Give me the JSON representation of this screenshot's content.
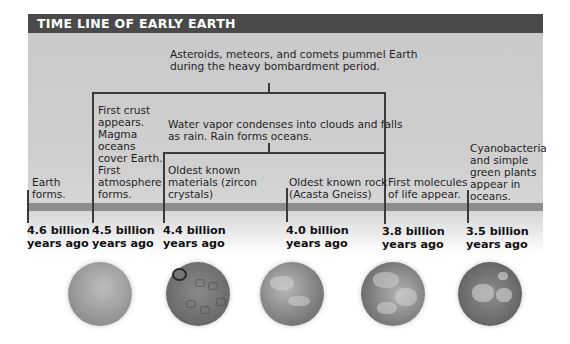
{
  "title": "TIME LINE OF EARLY EARTH",
  "brackets": {
    "bombardment": "Asteroids, meteors, and comets pummel Earth during the heavy bombardment period.",
    "bombardment_lines": [
      "Asteroids, meteors, and comets pummel Earth",
      "during the heavy bombardment period."
    ],
    "water_lines": [
      "Water vapor condenses into clouds and falls",
      "as rain. Rain forms oceans."
    ]
  },
  "events": [
    {
      "lines": [
        "Earth",
        "forms."
      ],
      "date_line1": "4.6 billion",
      "date_line2": "years ago"
    },
    {
      "lines": [
        "First crust",
        "appears.",
        "Magma",
        "oceans",
        "cover Earth.",
        "First",
        "atmosphere",
        "forms."
      ],
      "date_line1": "4.5 billion",
      "date_line2": "years ago"
    },
    {
      "lines": [
        "Oldest known",
        "materials (zircon",
        "crystals)"
      ],
      "date_line1": "4.4 billion",
      "date_line2": "years ago"
    },
    {
      "lines": [
        "Oldest known rock",
        "(Acasta Gneiss)"
      ],
      "date_line1": "4.0 billion",
      "date_line2": "years ago"
    },
    {
      "lines": [
        "First molecules",
        "of life appear."
      ],
      "date_line1": "3.8 billion",
      "date_line2": "years ago"
    },
    {
      "lines": [
        "Cyanobacteria",
        "and simple",
        "green plants",
        "appear in",
        "oceans."
      ],
      "date_line1": "3.5 billion",
      "date_line2": "years ago"
    }
  ],
  "spheres": [
    {
      "name": "molten-earth"
    },
    {
      "name": "cratered-earth"
    },
    {
      "name": "cloudy-earth"
    },
    {
      "name": "ocean-earth"
    },
    {
      "name": "continents-earth"
    }
  ]
}
